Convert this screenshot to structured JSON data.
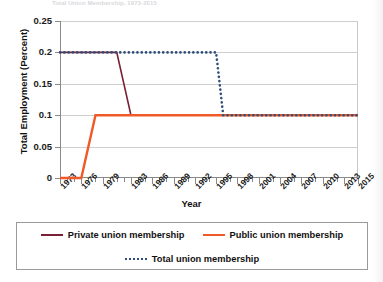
{
  "top_caption": "Total Union Membership, 1973-2015",
  "chart_data": {
    "type": "line",
    "title": "",
    "xlabel": "Year",
    "ylabel": "Total Employment (Percent)",
    "xlim": [
      1973,
      2015
    ],
    "ylim": [
      0,
      0.25
    ],
    "grid": true,
    "legend_position": "bottom",
    "y_ticks": [
      "0",
      "0.05",
      "0.1",
      "0.15",
      "0.2",
      "0.25"
    ],
    "y_tick_values": [
      0,
      0.05,
      0.1,
      0.15,
      0.2,
      0.25
    ],
    "x_tick_labels": [
      "1973",
      "1976",
      "1979",
      "1983",
      "1986",
      "1989",
      "1992",
      "1995",
      "1998",
      "2001",
      "2004",
      "2007",
      "2010",
      "2013",
      "2015"
    ],
    "x_tick_values": [
      1973,
      1976,
      1979,
      1983,
      1986,
      1989,
      1992,
      1995,
      1998,
      2001,
      2004,
      2007,
      2010,
      2013,
      2015
    ],
    "series": [
      {
        "name": "Private union membership",
        "color": "#7a1f35",
        "style": "solid",
        "x": [
          1973,
          1981,
          1983,
          2015
        ],
        "values": [
          0.2,
          0.2,
          0.1,
          0.1
        ]
      },
      {
        "name": "Public union membership",
        "color": "#ef5a28",
        "style": "solid",
        "x": [
          1973,
          1976,
          1978,
          2015
        ],
        "values": [
          0.0,
          0.0,
          0.1,
          0.1
        ]
      },
      {
        "name": "Total union membership",
        "color": "#2f4f7a",
        "style": "dotted",
        "x": [
          1973,
          1995,
          1996,
          2015
        ],
        "values": [
          0.2,
          0.2,
          0.1,
          0.1
        ]
      }
    ]
  },
  "legend": {
    "items": [
      {
        "label": "Private union membership",
        "color": "#7a1f35",
        "style": "solid"
      },
      {
        "label": "Public union membership",
        "color": "#ef5a28",
        "style": "solid"
      },
      {
        "label": "Total union membership",
        "color": "#2f4f7a",
        "style": "dotted"
      }
    ]
  }
}
